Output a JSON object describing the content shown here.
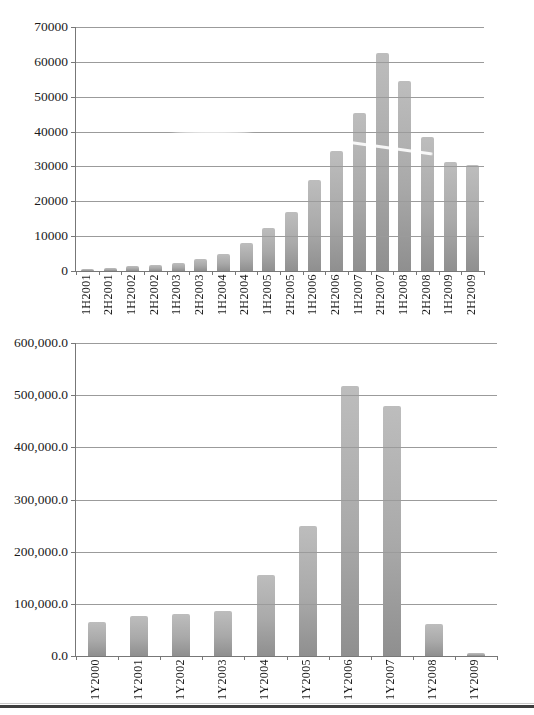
{
  "colors": {
    "page_bg": "#ffffff",
    "bar_top": "#bdbdbd",
    "bar_bottom": "#8f8f8f",
    "grid": "#9b9b9b",
    "axis": "#777777",
    "text": "#1b1b1b",
    "rule": "#3e3e3e"
  },
  "chart_data": [
    {
      "type": "bar",
      "title": "",
      "categories": [
        "1H2001",
        "2H2001",
        "1H2002",
        "2H2002",
        "1H2003",
        "2H2003",
        "1H2004",
        "2H2004",
        "1H2005",
        "2H2005",
        "1H2006",
        "2H2006",
        "1H2007",
        "2H2007",
        "1H2008",
        "2H2008",
        "1H2009",
        "2H2009"
      ],
      "values": [
        500,
        900,
        1400,
        1800,
        2200,
        3400,
        4900,
        8000,
        12300,
        16900,
        26000,
        34500,
        45400,
        62500,
        54500,
        38500,
        31200,
        30300
      ],
      "xlabel": "",
      "ylabel": "",
      "ylim": [
        0,
        70000
      ],
      "ytick_step": 10000,
      "ytick_labels": [
        "0",
        "10000",
        "20000",
        "30000",
        "40000",
        "50000",
        "60000",
        "70000"
      ],
      "grid": true,
      "legend": null
    },
    {
      "type": "bar",
      "title": "",
      "categories": [
        "1Y2000",
        "1Y2001",
        "1Y2002",
        "1Y2003",
        "1Y2004",
        "1Y2005",
        "1Y2006",
        "1Y2007",
        "1Y2008",
        "1Y2009"
      ],
      "values": [
        65000,
        77000,
        81000,
        86000,
        156000,
        249000,
        518000,
        479000,
        61000,
        5000
      ],
      "xlabel": "",
      "ylabel": "",
      "ylim": [
        0,
        600000
      ],
      "ytick_step": 100000,
      "ytick_labels": [
        "0.0",
        "100,000.0",
        "200,000.0",
        "300,000.0",
        "400,000.0",
        "500,000.0",
        "600,000.0"
      ],
      "grid": true,
      "legend": null
    }
  ]
}
